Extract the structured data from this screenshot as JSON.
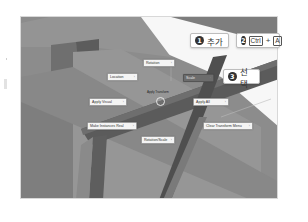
{
  "viewport": {
    "background": "#8a8a8a"
  },
  "pie_menu": {
    "title": "Apply Transform",
    "items": [
      {
        "label": "Rotation",
        "position": "top"
      },
      {
        "label": "Location",
        "position": "upper-left"
      },
      {
        "label": "Scale",
        "position": "upper-right"
      },
      {
        "label": "Apply Visual",
        "position": "left"
      },
      {
        "label": "Apply All",
        "position": "right"
      },
      {
        "label": "Make Instances Real",
        "position": "lower-left"
      },
      {
        "label": "Clear Transform Menu",
        "position": "lower-right"
      },
      {
        "label": "Rotation/Scale",
        "position": "bottom"
      }
    ]
  },
  "callouts": [
    {
      "number": "1",
      "text": "추가"
    },
    {
      "number": "2",
      "key1": "Ctrl",
      "plus": "+",
      "key2": "A"
    },
    {
      "number": "3",
      "text": "선택"
    }
  ]
}
